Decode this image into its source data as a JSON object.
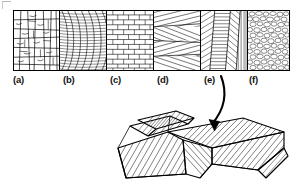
{
  "figure": {
    "panel_count": 6,
    "line_color": "#000000",
    "background_color": "#ffffff",
    "frame_color": "#000000"
  },
  "panels": [
    {
      "id": "a",
      "label": "(a)",
      "pattern": "blocky-irregular-jointed",
      "description": "Irregular blocky massive bedding with vertical joints and wavy horizontal partings"
    },
    {
      "id": "b",
      "label": "(b)",
      "pattern": "curved-concave-laminae",
      "description": "Trough / festoon cross-bedding with concave-up curved laminae"
    },
    {
      "id": "c",
      "label": "(c)",
      "pattern": "brick-masonry",
      "description": "Even parallel horizontal bedding with offset rectangular blocks"
    },
    {
      "id": "d",
      "label": "(d)",
      "pattern": "low-angle-cross-cutting",
      "description": "Low-angle cross-stratification with truncating inclined sets"
    },
    {
      "id": "e",
      "label": "(e)",
      "pattern": "herringbone-chevron",
      "description": "Herringbone cross-bedding with opposed dip directions"
    },
    {
      "id": "f",
      "label": "(f)",
      "pattern": "pebbly-conglomerate",
      "description": "Clast-supported pebbly conglomerate texture"
    }
  ],
  "label_positions_px": [
    12,
    63,
    110,
    157,
    204,
    249
  ],
  "arrow": {
    "name": "curved-pointer-arrow",
    "from_label": "(e)",
    "to_target": "block-diagram",
    "style": "curved solid arrow with filled head",
    "color": "#000000"
  },
  "block_diagram": {
    "name": "cross-bedded-dune-block",
    "description": "Three-dimensional block diagram of superimposed dune sets showing herringbone cross-stratification on the block faces",
    "face_count": 3,
    "hatch_color": "#000000",
    "outline_color": "#000000"
  }
}
